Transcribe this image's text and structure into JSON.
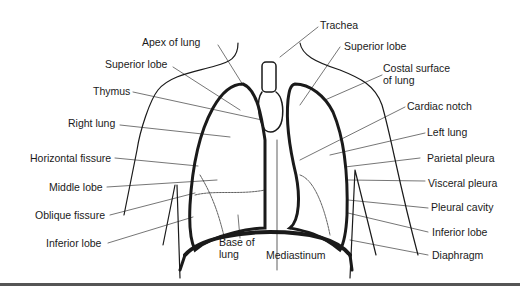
{
  "diagram": {
    "labels_left": [
      {
        "id": "apex",
        "text": "Apex of lung"
      },
      {
        "id": "superior_lobe_r",
        "text": "Superior lobe"
      },
      {
        "id": "thymus",
        "text": "Thymus"
      },
      {
        "id": "right_lung",
        "text": "Right lung"
      },
      {
        "id": "horizontal_fissure",
        "text": "Horizontal fissure"
      },
      {
        "id": "middle_lobe",
        "text": "Middle lobe"
      },
      {
        "id": "oblique_fissure",
        "text": "Oblique fissure"
      },
      {
        "id": "inferior_lobe_r",
        "text": "Inferior lobe"
      }
    ],
    "labels_right": [
      {
        "id": "trachea",
        "text": "Trachea"
      },
      {
        "id": "superior_lobe_l",
        "text": "Superior lobe"
      },
      {
        "id": "costal_surface_1",
        "text": "Costal surface"
      },
      {
        "id": "costal_surface_2",
        "text": "of lung"
      },
      {
        "id": "cardiac_notch",
        "text": "Cardiac notch"
      },
      {
        "id": "left_lung",
        "text": "Left lung"
      },
      {
        "id": "parietal_pleura",
        "text": "Parietal pleura"
      },
      {
        "id": "visceral_pleura",
        "text": "Visceral pleura"
      },
      {
        "id": "pleural_cavity",
        "text": "Pleural cavity"
      },
      {
        "id": "inferior_lobe_l",
        "text": "Inferior lobe"
      },
      {
        "id": "diaphragm",
        "text": "Diaphragm"
      }
    ],
    "labels_bottom": [
      {
        "id": "base_1",
        "text": "Base of"
      },
      {
        "id": "base_2",
        "text": "lung"
      },
      {
        "id": "mediastinum",
        "text": "Mediastinum"
      }
    ],
    "colors": {
      "ink": "#1a1a1a",
      "rule": "#555555",
      "background": "#ffffff"
    }
  }
}
